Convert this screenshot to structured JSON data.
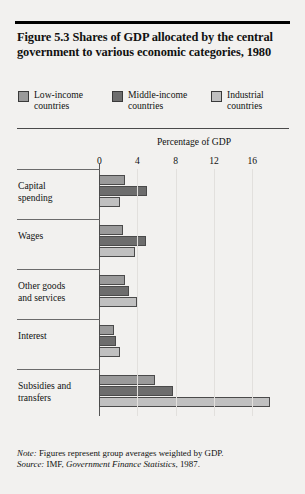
{
  "figure": {
    "title": "Figure 5.3  Shares of GDP allocated by the central government to various economic categories, 1980",
    "note_label": "Note:",
    "note_text": " Figures represent group averages weighted by GDP.",
    "source_label": "Source:",
    "source_text_pre": " IMF, ",
    "source_italic": "Government Finance Statistics",
    "source_text_post": ", 1987."
  },
  "colors": {
    "low_income": "#9a9a9a",
    "middle_income": "#6d6d6d",
    "industrial": "#c0c0c0",
    "bar_border": "#4a4a4a",
    "background": "#f2f1ef",
    "rule": "#000000",
    "gridline": "#e2e0dd"
  },
  "chart_data": {
    "type": "bar",
    "orientation": "horizontal",
    "title": "Figure 5.3  Shares of GDP allocated by the central government to various economic categories, 1980",
    "xlabel": "Percentage of GDP",
    "ylabel": "",
    "xlim": [
      0,
      19
    ],
    "xticks": [
      0,
      4,
      8,
      12,
      16
    ],
    "xtick_labels": [
      "0",
      "4",
      "8",
      "12",
      "16"
    ],
    "grid": "vertical",
    "legend_position": "top",
    "categories": [
      "Capital\nspending",
      "Wages",
      "Other goods\nand services",
      "Interest",
      "Subsidies and\ntransfers"
    ],
    "series": [
      {
        "name": "Low-income\ncountries",
        "legend": "Low-income countries",
        "color": "#9a9a9a",
        "values": [
          2.7,
          2.5,
          2.7,
          1.6,
          5.8
        ]
      },
      {
        "name": "Middle-income\ncountries",
        "legend": "Middle-income countries",
        "color": "#6d6d6d",
        "values": [
          5.0,
          4.9,
          3.1,
          1.8,
          7.7
        ]
      },
      {
        "name": "Industrial\ncountries",
        "legend": "Industrial countries",
        "color": "#c0c0c0",
        "values": [
          2.2,
          3.8,
          4.0,
          2.2,
          17.9
        ]
      }
    ]
  }
}
